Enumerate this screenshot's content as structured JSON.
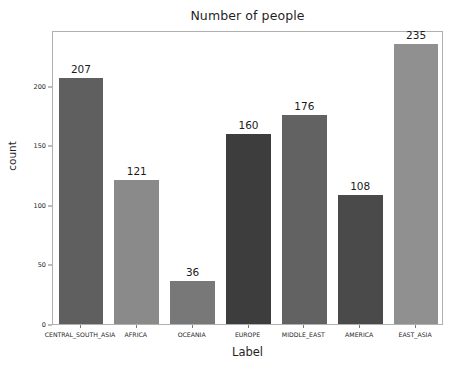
{
  "chart_data": {
    "type": "bar",
    "title": "Number of people",
    "xlabel": "Label",
    "ylabel": "count",
    "categories": [
      "CENTRAL_SOUTH_ASIA",
      "AFRICA",
      "OCEANIA",
      "EUROPE",
      "MIDDLE_EAST",
      "AMERICA",
      "EAST_ASIA"
    ],
    "values": [
      207,
      121,
      36,
      160,
      176,
      108,
      235
    ],
    "value_labels": [
      "207",
      "121",
      "36",
      "160",
      "176",
      "108",
      "235"
    ],
    "bar_colors": [
      "#5f5f5f",
      "#8a8a8a",
      "#787878",
      "#3d3d3d",
      "#626262",
      "#4a4a4a",
      "#909090"
    ],
    "ylim": [
      0,
      247
    ],
    "yticks": [
      0,
      50,
      100,
      150,
      200
    ],
    "ytick_labels": [
      "0",
      "50",
      "100",
      "150",
      "200"
    ],
    "grid": false,
    "legend": "none",
    "axes_edge_color": "#b0b0b0",
    "background_color": "#ffffff",
    "text_color": "#1f1f1f"
  }
}
